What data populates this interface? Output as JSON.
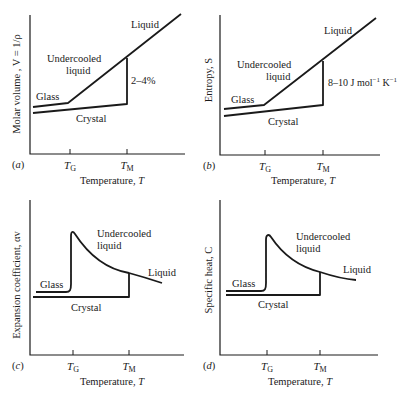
{
  "figure": {
    "background": "#ffffff",
    "ink": "#1a1a1a",
    "xlabel_common": "Temperature, T",
    "tick_labels": {
      "TG": "T",
      "TG_sub": "G",
      "TM": "T",
      "TM_sub": "M"
    }
  },
  "chart_data": [
    {
      "type": "line",
      "panel": "(a)",
      "ylabel": "Molar volume , V = 1/ρ",
      "xlabel": "Temperature, T",
      "ticks": [
        "TG",
        "TM"
      ],
      "annotations": [
        "Liquid",
        "Undercooled liquid",
        "Glass",
        "Crystal",
        "2–4%"
      ],
      "series": [
        {
          "name": "Liquid / Undercooled liquid",
          "shape": "straight line rising from TG to beyond TM"
        },
        {
          "name": "Glass",
          "shape": "shallow slope below TG"
        },
        {
          "name": "Crystal",
          "shape": "shallow slope up to TM, jump of 2–4% at TM"
        }
      ]
    },
    {
      "type": "line",
      "panel": "(b)",
      "ylabel": "Entropy, S",
      "xlabel": "Temperature, T",
      "ticks": [
        "TG",
        "TM"
      ],
      "annotations": [
        "Liquid",
        "Undercooled liquid",
        "Glass",
        "Crystal",
        "8–10 J mol⁻¹ K⁻¹"
      ],
      "series": [
        {
          "name": "Liquid / Undercooled liquid",
          "shape": "straight line rising"
        },
        {
          "name": "Glass",
          "shape": "shallow slope below TG"
        },
        {
          "name": "Crystal",
          "shape": "shallow slope, jump of 8–10 J mol⁻¹ K⁻¹ at TM"
        }
      ]
    },
    {
      "type": "line",
      "panel": "(c)",
      "ylabel": "Expansion coefficient, αv",
      "xlabel": "Temperature, T",
      "ticks": [
        "TG",
        "TM"
      ],
      "annotations": [
        "Undercooled liquid",
        "Liquid",
        "Glass",
        "Crystal"
      ],
      "series": [
        {
          "name": "Glass",
          "shape": "flat, sharp rise at TG"
        },
        {
          "name": "Undercooled liquid / Liquid",
          "shape": "decaying curve from peak at TG"
        },
        {
          "name": "Crystal",
          "shape": "flat to TM"
        }
      ]
    },
    {
      "type": "line",
      "panel": "(d)",
      "ylabel": "Specific heat, C",
      "xlabel": "Temperature, T",
      "ticks": [
        "TG",
        "TM"
      ],
      "annotations": [
        "Undercooled liquid",
        "Liquid",
        "Glass",
        "Crystal"
      ],
      "series": [
        {
          "name": "Glass",
          "shape": "flat, sharp rise at TG"
        },
        {
          "name": "Undercooled liquid / Liquid",
          "shape": "decaying curve from peak at TG"
        },
        {
          "name": "Crystal",
          "shape": "flat to TM"
        }
      ]
    }
  ],
  "panels": [
    {
      "id": "a",
      "tag": "(",
      "tag_letter": "a",
      "tag_close": ")",
      "ylabel": "Molar volume , V = 1/ρ",
      "xlabel": "Temperature, T",
      "axis": {
        "x0": 30,
        "y0": 154,
        "x1": 185,
        "ytop": 15
      },
      "tg": 70,
      "tm": 127,
      "paths": [
        "M33,107 L68,103 L181,14",
        "M33,113 L127,104 L127,58"
      ],
      "labels": [
        {
          "text": "Liquid",
          "x": 131,
          "y": 28
        },
        {
          "text": "Undercooled",
          "x": 47,
          "y": 62
        },
        {
          "text": "liquid",
          "x": 66,
          "y": 74
        },
        {
          "text": "Glass",
          "x": 36,
          "y": 100
        },
        {
          "text": "Crystal",
          "x": 76,
          "y": 122
        },
        {
          "text": "2–4%",
          "x": 131,
          "y": 84
        }
      ],
      "tag_pos": {
        "x": 12,
        "y": 168
      },
      "xlabel_pos": {
        "x": 112,
        "y": 184
      },
      "ylabel_pos": {
        "x": 20,
        "y": 84
      }
    },
    {
      "id": "b",
      "tag": "(",
      "tag_letter": "b",
      "tag_close": ")",
      "ylabel": "Entropy, S",
      "xlabel": "Temperature, T",
      "axis": {
        "x0": 220,
        "y0": 155,
        "x1": 380,
        "ytop": 15
      },
      "tg": 265,
      "tm": 323,
      "paths": [
        "M224,109 L264,105 L376,18",
        "M224,116 L323,105 L323,61"
      ],
      "labels": [
        {
          "text": "Liquid",
          "x": 324,
          "y": 34
        },
        {
          "text": "Undercooled",
          "x": 237,
          "y": 68
        },
        {
          "text": "liquid",
          "x": 266,
          "y": 80
        },
        {
          "text": "Glass",
          "x": 231,
          "y": 103
        },
        {
          "text": "Crystal",
          "x": 268,
          "y": 125
        }
      ],
      "energy_label": {
        "main": "8–10 J mol",
        "sup1": "−1",
        "mid": " K",
        "sup2": "−1",
        "x": 328,
        "y": 86
      },
      "tag_pos": {
        "x": 203,
        "y": 169
      },
      "xlabel_pos": {
        "x": 303,
        "y": 184
      },
      "ylabel_pos": {
        "x": 212,
        "y": 80
      }
    },
    {
      "id": "c",
      "tag": "(",
      "tag_letter": "c",
      "tag_close": ")",
      "ylabel": "Expansion coefficient, αv",
      "xlabel": "Temperature, T",
      "axis": {
        "x0": 30,
        "y0": 355,
        "x1": 184,
        "ytop": 200
      },
      "tg": 73,
      "tm": 129,
      "paths": [
        "M36,292 L66,292 C70,292 71,290 71,284 L71,236 C71,231 73,231 75,234 C88,254 106,269 129,273 C140,276 150,279 162,283",
        "M33,297 L129,297 L129,273"
      ],
      "labels": [
        {
          "text": "Undercooled",
          "x": 97,
          "y": 237
        },
        {
          "text": "liquid",
          "x": 97,
          "y": 249
        },
        {
          "text": "Liquid",
          "x": 148,
          "y": 276
        },
        {
          "text": "Glass",
          "x": 40,
          "y": 288
        },
        {
          "text": "Crystal",
          "x": 71,
          "y": 311
        }
      ],
      "tag_pos": {
        "x": 12,
        "y": 369
      },
      "xlabel_pos": {
        "x": 112,
        "y": 385
      },
      "ylabel_pos": {
        "x": 20,
        "y": 285
      }
    },
    {
      "id": "d",
      "tag": "(",
      "tag_letter": "d",
      "tag_close": ")",
      "ylabel": "Specific heat, C",
      "xlabel": "Temperature, T",
      "axis": {
        "x0": 220,
        "y0": 355,
        "x1": 378,
        "ytop": 200
      },
      "tg": 267,
      "tm": 320,
      "paths": [
        "M226,291 L261,291 C265,291 266,289 266,283 L266,240 C266,234 269,234 271,237 C283,255 300,267 320,272 C332,276 343,279 356,280",
        "M226,295 L320,295 L320,272"
      ],
      "labels": [
        {
          "text": "Undercooled",
          "x": 296,
          "y": 240
        },
        {
          "text": "liquid",
          "x": 296,
          "y": 252
        },
        {
          "text": "Liquid",
          "x": 343,
          "y": 273
        },
        {
          "text": "Glass",
          "x": 232,
          "y": 287
        },
        {
          "text": "Crystal",
          "x": 258,
          "y": 308
        }
      ],
      "tag_pos": {
        "x": 203,
        "y": 369
      },
      "xlabel_pos": {
        "x": 300,
        "y": 385
      },
      "ylabel_pos": {
        "x": 212,
        "y": 280
      }
    }
  ]
}
